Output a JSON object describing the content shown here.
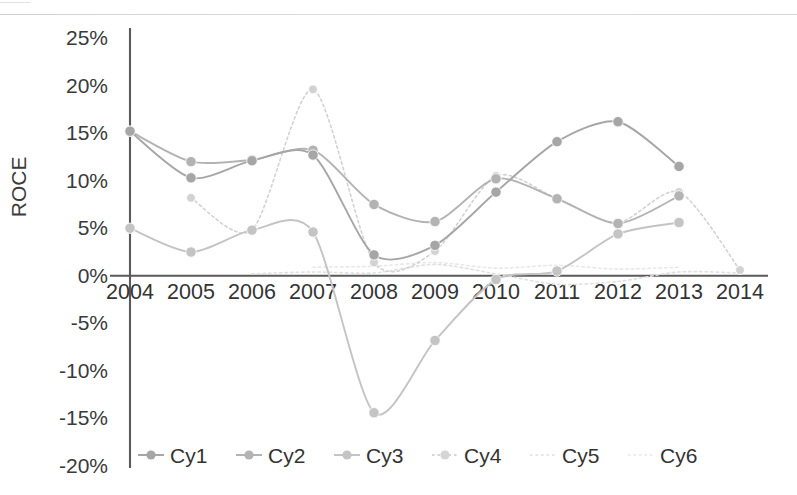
{
  "chart_data": {
    "type": "line",
    "title": "",
    "xlabel": "",
    "ylabel": "ROCE",
    "x": [
      2004,
      2005,
      2006,
      2007,
      2008,
      2009,
      2010,
      2011,
      2012,
      2013,
      2014
    ],
    "categories": [
      "2004",
      "2005",
      "2006",
      "2007",
      "2008",
      "2009",
      "2010",
      "2011",
      "2012",
      "2013",
      "2014"
    ],
    "ytick_labels": [
      "25%",
      "20%",
      "15%",
      "10%",
      "5%",
      "0%",
      "-5%",
      "-10%",
      "-15%",
      "-20%"
    ],
    "ytick_values": [
      25,
      20,
      15,
      10,
      5,
      0,
      -5,
      -10,
      -15,
      -20
    ],
    "ylim": [
      -20,
      25
    ],
    "xlim": [
      2004,
      2014
    ],
    "yunit": "percent",
    "grid": false,
    "legend_position": "bottom",
    "smoothing": "spline",
    "series": [
      {
        "name": "Cy1",
        "color": "#a6a6a6",
        "style": "solid",
        "marker": "circle",
        "x": [
          2004,
          2005,
          2006,
          2007,
          2008,
          2009,
          2010,
          2011,
          2012,
          2013
        ],
        "values": [
          15.2,
          10.3,
          12.1,
          12.7,
          2.2,
          3.2,
          8.8,
          14.1,
          16.2,
          11.5
        ]
      },
      {
        "name": "Cy2",
        "color": "#b3b3b3",
        "style": "solid",
        "marker": "circle",
        "x": [
          2004,
          2005,
          2006,
          2007,
          2008,
          2009,
          2010,
          2011,
          2012,
          2013
        ],
        "values": [
          15.2,
          12.0,
          12.2,
          13.2,
          7.5,
          5.7,
          10.2,
          8.1,
          5.5,
          8.4
        ]
      },
      {
        "name": "Cy3",
        "color": "#c4c4c4",
        "style": "solid",
        "marker": "circle",
        "x": [
          2004,
          2005,
          2006,
          2007,
          2008,
          2009,
          2010,
          2011,
          2012,
          2013
        ],
        "values": [
          5.0,
          2.5,
          4.8,
          4.6,
          -14.4,
          -6.8,
          -0.4,
          0.5,
          4.4,
          5.6
        ]
      },
      {
        "name": "Cy4",
        "color": "#d2d2d2",
        "style": "dotted",
        "marker": "circle",
        "x": [
          2005,
          2006,
          2007,
          2008,
          2009,
          2010,
          2011,
          2012,
          2013,
          2014
        ],
        "values": [
          8.2,
          4.8,
          19.6,
          1.4,
          2.6,
          10.5,
          8.1,
          5.6,
          8.8,
          0.6
        ]
      },
      {
        "name": "Cy5",
        "color": "#e0e0e0",
        "style": "dotted",
        "marker": "none",
        "x": [
          2006,
          2007,
          2008,
          2009,
          2010,
          2011,
          2012,
          2013,
          2014
        ],
        "values": [
          0.2,
          0.4,
          0.3,
          1.2,
          0.2,
          -0.9,
          -0.6,
          0.4,
          0.3
        ]
      },
      {
        "name": "Cy6",
        "color": "#e8e8e8",
        "style": "dotted",
        "marker": "none",
        "x": [
          2007,
          2008,
          2009,
          2010,
          2011,
          2012,
          2013
        ],
        "values": [
          0.9,
          1.0,
          1.4,
          0.8,
          1.1,
          0.7,
          0.9
        ]
      }
    ],
    "legend": [
      {
        "label": "Cy1",
        "color": "#a6a6a6",
        "marker": "circle",
        "style": "solid"
      },
      {
        "label": "Cy2",
        "color": "#b3b3b3",
        "marker": "circle",
        "style": "solid"
      },
      {
        "label": "Cy3",
        "color": "#c4c4c4",
        "marker": "circle",
        "style": "solid"
      },
      {
        "label": "Cy4",
        "color": "#d5d5d5",
        "marker": "circle",
        "style": "dotted"
      },
      {
        "label": "Cy5",
        "color": "#e6e6e6",
        "marker": "none",
        "style": "dotted"
      },
      {
        "label": "Cy6",
        "color": "#ededed",
        "marker": "none",
        "style": "dotted"
      }
    ]
  },
  "axis": {
    "y_title": "ROCE",
    "axis_color": "#5a5a5a"
  }
}
